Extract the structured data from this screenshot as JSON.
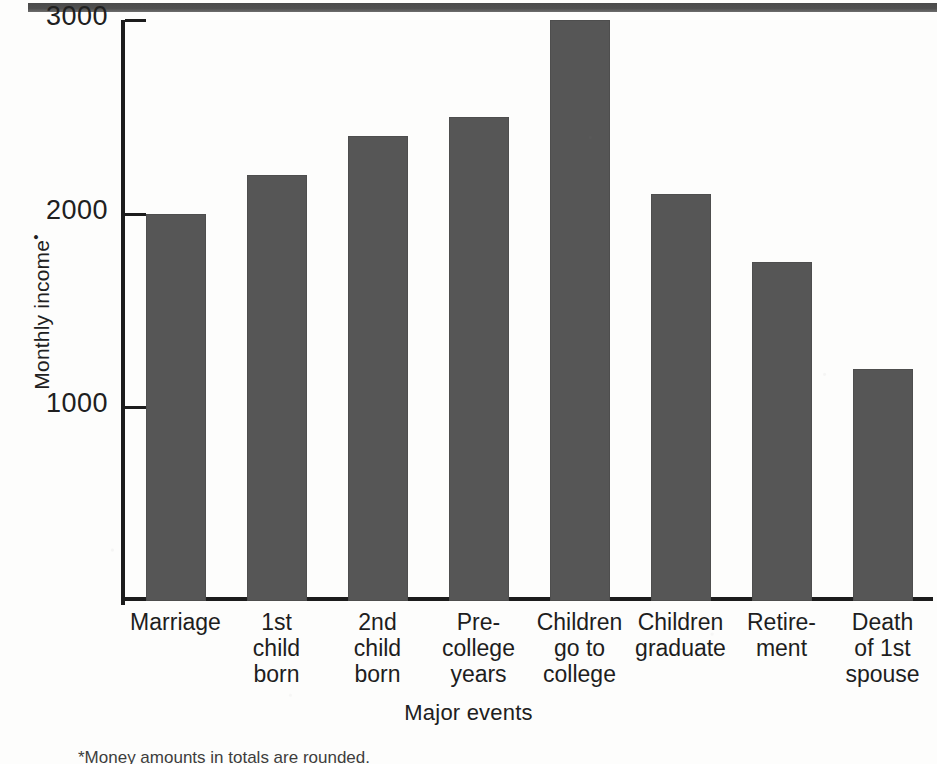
{
  "page": {
    "background_color": "#fdfdfc",
    "top_rule_color": "#4f4f4f"
  },
  "chart_data": {
    "type": "bar",
    "title": "",
    "xlabel": "Major events",
    "ylabel": "Monthly income",
    "ylabel_footnote_mark": "•",
    "categories": [
      "Marriage",
      "1st\nchild\nborn",
      "2nd\nchild\nborn",
      "Pre-\ncollege\nyears",
      "Children\ngo to\ncollege",
      "Children\ngraduate",
      "Retire-\nment",
      "Death\nof 1st\nspouse"
    ],
    "values": [
      2000,
      2200,
      2400,
      2500,
      3000,
      2100,
      1750,
      1200
    ],
    "ylim": [
      0,
      3000
    ],
    "yticks": [
      1000,
      2000,
      3000
    ],
    "ytick_labels": [
      "1000",
      "2000",
      "3000"
    ],
    "grid": false,
    "legend": false,
    "bar_color": "#565656",
    "axis_color": "#1c1c1c"
  },
  "footnote": {
    "text": "*Money amounts in totals are rounded."
  }
}
